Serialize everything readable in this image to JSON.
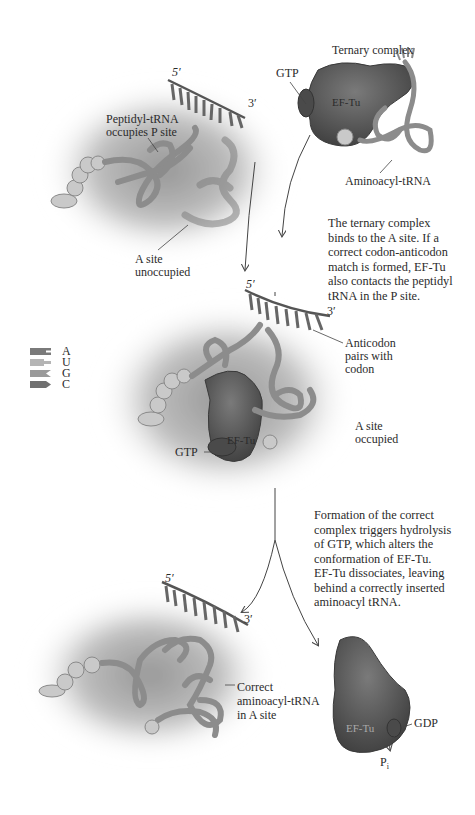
{
  "diagram": {
    "colors": {
      "ribosome_haze": "#9a9a9a",
      "ef_tu": "#5f5f5f",
      "trna": "#8e8e8e",
      "amino_acid": "#c9c9c9",
      "mrna_strand": "#6a6a6a",
      "text": "#2b2b2b"
    },
    "panel1": {
      "mrna_5prime": "5′",
      "mrna_3prime": "3′",
      "peptidyl_label_line1": "Peptidyl-tRNA",
      "peptidyl_label_line2": "occupies P site",
      "a_site_line1": "A site",
      "a_site_line2": "unoccupied"
    },
    "ternary": {
      "title": "Ternary complex",
      "gtp": "GTP",
      "ef_tu": "EF-Tu",
      "aminoacyl": "Aminoacyl-tRNA"
    },
    "step1_text": [
      "The ternary complex",
      "binds to the A site. If a",
      "correct codon-anticodon",
      "match is formed, EF-Tu",
      "also contacts the peptidyl",
      "tRNA in the P site."
    ],
    "panel2": {
      "mrna_5prime": "5′",
      "mrna_3prime": "3′",
      "anticodon_line1": "Anticodon",
      "anticodon_line2": "pairs with",
      "anticodon_line3": "codon",
      "a_site_line1": "A site",
      "a_site_line2": "occupied",
      "gtp": "GTP",
      "ef_tu": "EF-Tu"
    },
    "legend": [
      {
        "base": "A",
        "color": "#7a7a7a",
        "shape": "notch"
      },
      {
        "base": "U",
        "color": "#b5b5b5",
        "shape": "tab"
      },
      {
        "base": "G",
        "color": "#9a9a9a",
        "shape": "chevron"
      },
      {
        "base": "C",
        "color": "#707070",
        "shape": "arrow"
      }
    ],
    "step2_text": [
      "Formation of the correct",
      "complex triggers hydrolysis",
      "of GTP, which alters the",
      "conformation of EF-Tu.",
      "EF-Tu dissociates, leaving",
      "behind a correctly inserted",
      "aminoacyl tRNA."
    ],
    "panel3": {
      "mrna_5prime": "5′",
      "mrna_3prime": "3′",
      "correct_line1": "Correct",
      "correct_line2": "aminoacyl-tRNA",
      "correct_line3": "in A site"
    },
    "released": {
      "ef_tu": "EF-Tu",
      "gdp": "GDP",
      "pi": "P",
      "pi_sub": "i"
    }
  }
}
